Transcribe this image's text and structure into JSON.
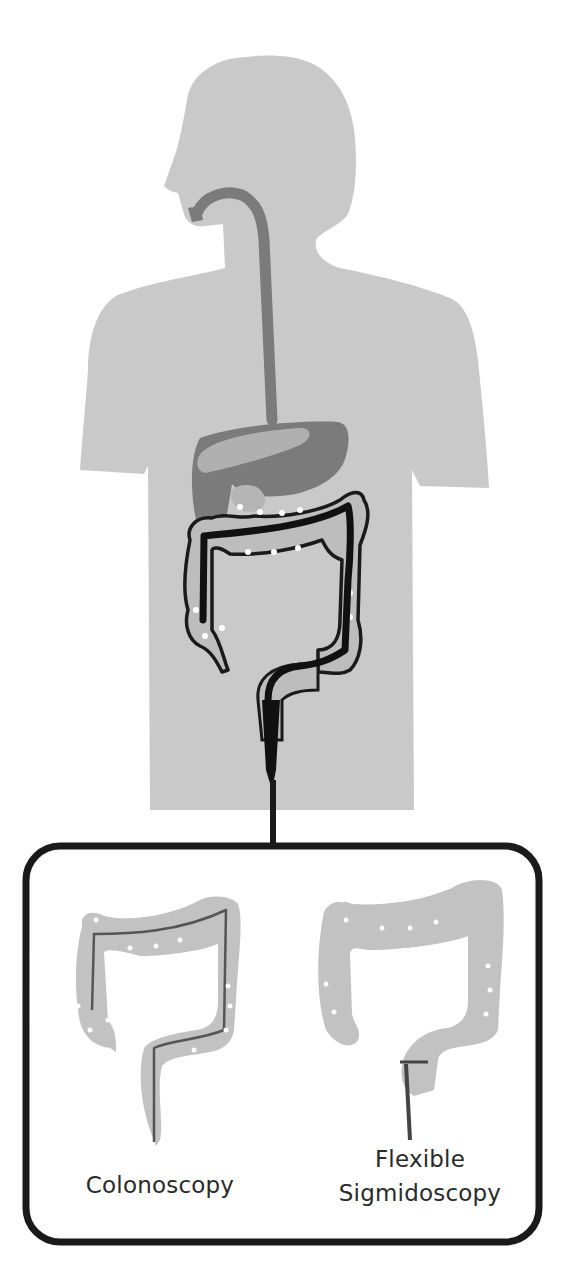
{
  "figure": {
    "colors": {
      "background": "#ffffff",
      "body_silhouette": "#c9c9c9",
      "organs_dark": "#7b7b7b",
      "organ_light": "#b0b0b0",
      "colon_fill": "#bdbdbd",
      "scope": "#111111",
      "outline": "#1a1a1a",
      "box_stroke": "#1a1a1a",
      "label_text": "#2a2a2a"
    }
  },
  "panels": [
    {
      "id": "colonoscopy",
      "label": "Colonoscopy",
      "scope_extent": "entire colon"
    },
    {
      "id": "flexible-sigmoidoscopy",
      "label_line1": "Flexible",
      "label_line2": "Sigmidoscopy",
      "scope_extent": "sigmoid colon / rectum"
    }
  ]
}
